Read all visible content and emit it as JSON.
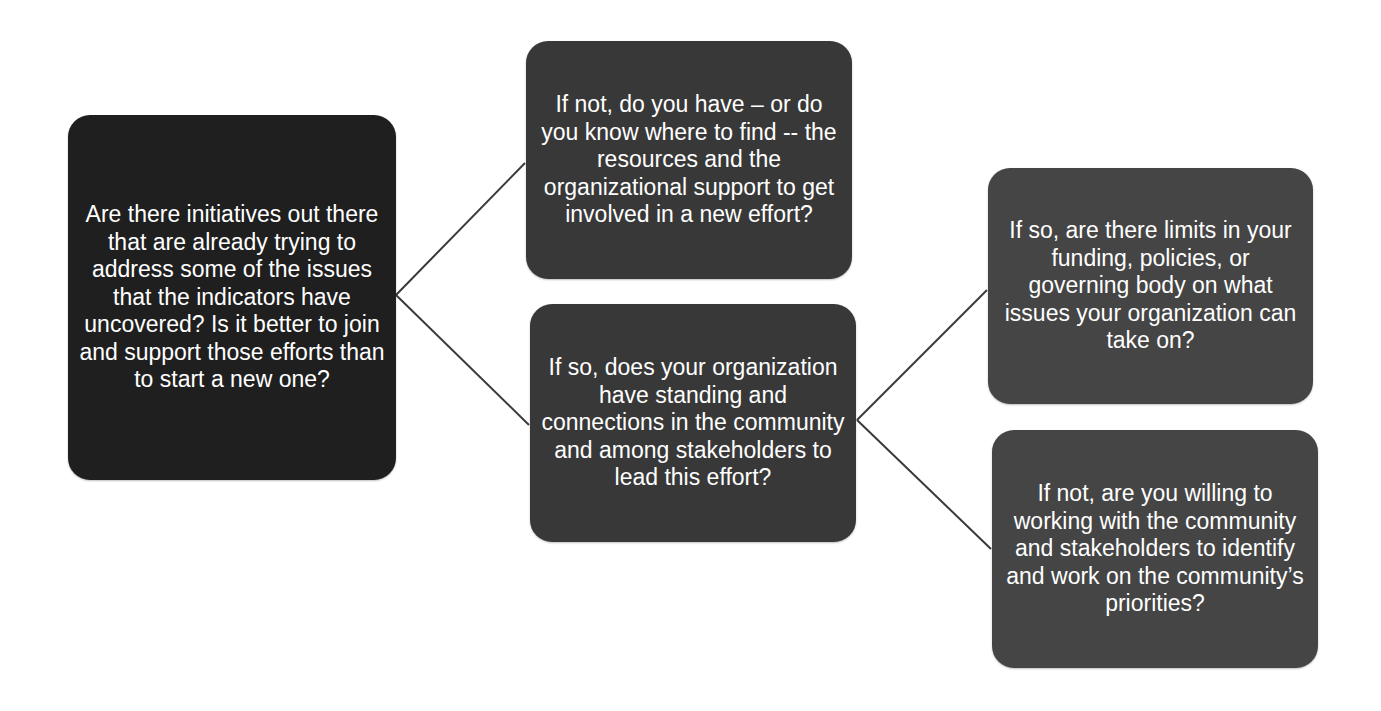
{
  "diagram": {
    "type": "decision-tree",
    "colors": {
      "background": "#ffffff",
      "level1_fill": "#1f1f1f",
      "level2_fill": "#383838",
      "level3_fill": "#454545",
      "text": "#ffffff",
      "connector": "#3a3a3a"
    },
    "nodes": {
      "root": {
        "text": "Are there initiatives out there that are already trying to address some of the issues that the indicators have uncovered?  Is it better to join and support those efforts than to start a new one?"
      },
      "no_initiatives": {
        "text": "If not, do you have – or do you know where to find -- the resources and the organizational support to get involved in a new effort?"
      },
      "has_initiatives": {
        "text": "If so, does your organization have standing and connections in the community and among stakeholders to lead this effort?"
      },
      "so_limits": {
        "text": "If so, are there limits in your funding, policies, or governing body on what issues your organization can take on?"
      },
      "not_willing": {
        "text": "If not, are you willing to working with the community and stakeholders to identify and work on the community’s priorities?"
      }
    },
    "edges": [
      {
        "from": "root",
        "to": "no_initiatives"
      },
      {
        "from": "root",
        "to": "has_initiatives"
      },
      {
        "from": "has_initiatives",
        "to": "so_limits"
      },
      {
        "from": "has_initiatives",
        "to": "not_willing"
      }
    ]
  }
}
